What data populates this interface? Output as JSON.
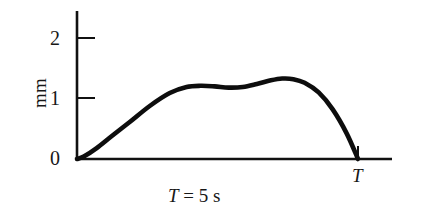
{
  "figure": {
    "background_color": "#ffffff",
    "ink_color": "#111111"
  },
  "axes": {
    "y_label": "mm",
    "y_ticks": [
      "0",
      "1",
      "2"
    ],
    "x_tick_label": "T"
  },
  "caption": {
    "symbol": "T",
    "equals": "=",
    "value": "5",
    "unit": "s",
    "full_text": "T = 5 s"
  },
  "chart_data": {
    "type": "line",
    "title": "",
    "xlabel": "T = 5 s",
    "ylabel": "mm",
    "xlim": [
      0,
      5
    ],
    "ylim": [
      0,
      2.4
    ],
    "grid": false,
    "legend": null,
    "x_tick_labels": [
      "T"
    ],
    "x_tick_values": [
      5
    ],
    "y_tick_labels": [
      "0",
      "1",
      "2"
    ],
    "y_tick_values": [
      0,
      1,
      2
    ],
    "annotations": [
      "T = 5 s"
    ],
    "series": [
      {
        "name": "displacement",
        "units": "mm",
        "x": [
          0.0,
          0.12,
          0.35,
          0.62,
          0.95,
          1.3,
          1.65,
          1.95,
          2.2,
          2.45,
          2.7,
          2.95,
          3.2,
          3.45,
          3.65,
          3.85,
          4.05,
          4.3,
          4.55,
          4.8,
          5.0
        ],
        "values": [
          0.0,
          0.04,
          0.18,
          0.38,
          0.62,
          0.88,
          1.09,
          1.19,
          1.21,
          1.2,
          1.18,
          1.19,
          1.24,
          1.3,
          1.33,
          1.32,
          1.26,
          1.1,
          0.82,
          0.42,
          0.0
        ]
      }
    ]
  }
}
